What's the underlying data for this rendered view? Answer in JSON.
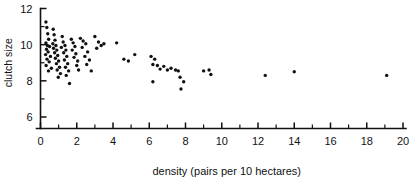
{
  "chart_data": {
    "type": "scatter",
    "title": "",
    "xlabel": "density (pairs per 10 hectares)",
    "ylabel": "clutch size",
    "xlim": [
      0,
      20
    ],
    "ylim": [
      5.4,
      12
    ],
    "grid": false,
    "legend": null,
    "x_ticks_major": [
      0,
      2,
      4,
      6,
      8,
      10,
      12,
      14,
      16,
      18,
      20
    ],
    "x_tick_labels": [
      "0",
      "2",
      "4",
      "6",
      "8",
      "10",
      "12",
      "14",
      "16",
      "18",
      "20"
    ],
    "x_ticks_minor": [
      1,
      3,
      5,
      7,
      9,
      11,
      13,
      15,
      17,
      19
    ],
    "y_ticks_major": [
      6,
      8,
      10,
      12
    ],
    "y_tick_labels": [
      "6",
      "8",
      "10",
      "12"
    ],
    "y_ticks_minor": [
      7,
      9,
      11
    ],
    "marker": "filled-circle",
    "marker_color": "#111111",
    "points": [
      [
        0.3,
        11.25
      ],
      [
        0.35,
        10.95
      ],
      [
        0.4,
        10.6
      ],
      [
        0.45,
        10.3
      ],
      [
        0.3,
        10.1
      ],
      [
        0.38,
        9.95
      ],
      [
        0.5,
        9.9
      ],
      [
        0.33,
        9.75
      ],
      [
        0.42,
        9.6
      ],
      [
        0.28,
        9.45
      ],
      [
        0.55,
        9.35
      ],
      [
        0.36,
        9.2
      ],
      [
        0.48,
        9.05
      ],
      [
        0.31,
        8.85
      ],
      [
        0.6,
        8.7
      ],
      [
        0.44,
        8.55
      ],
      [
        0.7,
        10.85
      ],
      [
        0.75,
        10.55
      ],
      [
        0.8,
        10.25
      ],
      [
        0.68,
        10.05
      ],
      [
        0.85,
        9.95
      ],
      [
        0.72,
        9.8
      ],
      [
        0.9,
        9.7
      ],
      [
        0.78,
        9.55
      ],
      [
        0.95,
        9.4
      ],
      [
        0.82,
        9.25
      ],
      [
        1.0,
        9.1
      ],
      [
        0.88,
        8.95
      ],
      [
        1.05,
        8.75
      ],
      [
        0.92,
        8.6
      ],
      [
        1.1,
        8.4
      ],
      [
        0.98,
        8.2
      ],
      [
        1.2,
        10.45
      ],
      [
        1.25,
        10.15
      ],
      [
        1.35,
        9.95
      ],
      [
        1.15,
        9.85
      ],
      [
        1.4,
        9.7
      ],
      [
        1.28,
        9.55
      ],
      [
        1.45,
        9.35
      ],
      [
        1.32,
        9.15
      ],
      [
        1.5,
        8.95
      ],
      [
        1.38,
        8.75
      ],
      [
        1.55,
        8.55
      ],
      [
        1.42,
        8.3
      ],
      [
        1.6,
        7.85
      ],
      [
        1.7,
        10.3
      ],
      [
        1.8,
        10.1
      ],
      [
        1.9,
        9.9
      ],
      [
        1.75,
        9.7
      ],
      [
        1.95,
        9.5
      ],
      [
        1.85,
        9.3
      ],
      [
        2.05,
        9.1
      ],
      [
        2.0,
        8.85
      ],
      [
        2.1,
        8.6
      ],
      [
        2.2,
        10.35
      ],
      [
        2.35,
        10.2
      ],
      [
        2.5,
        10.05
      ],
      [
        2.3,
        9.85
      ],
      [
        2.6,
        9.6
      ],
      [
        2.45,
        9.35
      ],
      [
        2.7,
        9.15
      ],
      [
        2.55,
        8.9
      ],
      [
        2.8,
        8.55
      ],
      [
        3.0,
        10.45
      ],
      [
        3.2,
        10.15
      ],
      [
        3.35,
        9.95
      ],
      [
        3.1,
        9.8
      ],
      [
        3.5,
        10.05
      ],
      [
        4.2,
        10.1
      ],
      [
        4.6,
        9.2
      ],
      [
        4.85,
        9.1
      ],
      [
        5.2,
        9.45
      ],
      [
        6.1,
        9.35
      ],
      [
        6.3,
        9.2
      ],
      [
        6.2,
        8.9
      ],
      [
        6.45,
        8.85
      ],
      [
        6.6,
        8.65
      ],
      [
        6.8,
        8.8
      ],
      [
        7.0,
        8.6
      ],
      [
        7.2,
        8.7
      ],
      [
        7.45,
        8.6
      ],
      [
        7.6,
        8.55
      ],
      [
        7.7,
        8.2
      ],
      [
        6.2,
        7.95
      ],
      [
        7.9,
        7.95
      ],
      [
        7.75,
        7.55
      ],
      [
        9.0,
        8.55
      ],
      [
        9.3,
        8.6
      ],
      [
        9.4,
        8.35
      ],
      [
        12.4,
        8.3
      ],
      [
        14.0,
        8.5
      ],
      [
        19.1,
        8.3
      ]
    ]
  }
}
